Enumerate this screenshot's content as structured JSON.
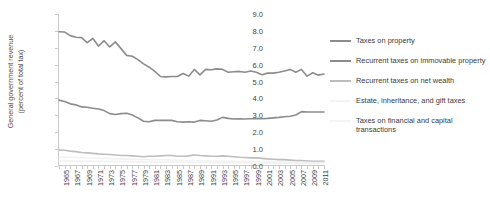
{
  "chart_data": {
    "type": "line",
    "title": "",
    "xlabel": "",
    "ylabel": "General government revenue\n(percent of total tax)",
    "ylim": [
      0.0,
      9.0
    ],
    "xlim": [
      1965,
      2012
    ],
    "grid": false,
    "legend_position": "right",
    "ytick_labels": [
      "0.0",
      "1.0",
      "2.0",
      "3.0",
      "4.0",
      "5.0",
      "6.0",
      "7.0",
      "8.0",
      "9.0"
    ],
    "ytick_values": [
      0.0,
      1.0,
      2.0,
      3.0,
      4.0,
      5.0,
      6.0,
      7.0,
      8.0,
      9.0
    ],
    "x": [
      1965,
      1966,
      1967,
      1968,
      1969,
      1970,
      1971,
      1972,
      1973,
      1974,
      1975,
      1976,
      1977,
      1978,
      1979,
      1980,
      1981,
      1982,
      1983,
      1984,
      1985,
      1986,
      1987,
      1988,
      1989,
      1990,
      1991,
      1992,
      1993,
      1994,
      1995,
      1996,
      1997,
      1998,
      1999,
      2000,
      2001,
      2002,
      2003,
      2004,
      2005,
      2006,
      2007,
      2008,
      2009,
      2010,
      2011,
      2012
    ],
    "xtick_labels": [
      "1965",
      "1967",
      "1969",
      "1971",
      "1973",
      "1975",
      "1977",
      "1979",
      "1981",
      "1983",
      "1985",
      "1987",
      "1989",
      "1991",
      "1993",
      "1995",
      "1997",
      "1999",
      "2001",
      "2003",
      "2005",
      "2007",
      "2009",
      "2011"
    ],
    "series": [
      {
        "name": "Taxes on property",
        "color": "#8c8c8c",
        "values": [
          7.95,
          7.93,
          7.72,
          7.62,
          7.6,
          7.3,
          7.55,
          7.1,
          7.42,
          7.05,
          7.35,
          6.95,
          6.55,
          6.5,
          6.3,
          6.05,
          5.85,
          5.6,
          5.3,
          5.28,
          5.3,
          5.3,
          5.48,
          5.32,
          5.72,
          5.4,
          5.72,
          5.7,
          5.75,
          5.72,
          5.55,
          5.58,
          5.6,
          5.55,
          5.62,
          5.55,
          5.4,
          5.5,
          5.5,
          5.55,
          5.62,
          5.72,
          5.55,
          5.72,
          5.32,
          5.52,
          5.38,
          5.45
        ]
      },
      {
        "name": "Recurrent taxes on immovable property",
        "color": "#8c8c8c",
        "values": [
          3.9,
          3.82,
          3.68,
          3.62,
          3.5,
          3.48,
          3.42,
          3.38,
          3.28,
          3.1,
          3.05,
          3.1,
          3.12,
          3.02,
          2.85,
          2.65,
          2.62,
          2.7,
          2.7,
          2.7,
          2.7,
          2.62,
          2.6,
          2.62,
          2.6,
          2.7,
          2.68,
          2.65,
          2.72,
          2.88,
          2.82,
          2.78,
          2.8,
          2.78,
          2.8,
          2.8,
          2.8,
          2.82,
          2.85,
          2.88,
          2.92,
          2.95,
          3.02,
          3.22,
          3.2,
          3.2,
          3.2,
          3.2
        ]
      },
      {
        "name": "Recurrent taxes on net wealth",
        "color": "#bdbdbd",
        "values": [
          0.95,
          0.93,
          0.88,
          0.85,
          0.8,
          0.78,
          0.75,
          0.72,
          0.7,
          0.68,
          0.65,
          0.62,
          0.62,
          0.6,
          0.58,
          0.55,
          0.58,
          0.58,
          0.6,
          0.62,
          0.62,
          0.58,
          0.58,
          0.6,
          0.65,
          0.62,
          0.6,
          0.58,
          0.58,
          0.6,
          0.58,
          0.55,
          0.52,
          0.5,
          0.48,
          0.48,
          0.45,
          0.42,
          0.4,
          0.38,
          0.38,
          0.35,
          0.32,
          0.32,
          0.3,
          0.28,
          0.28,
          0.28
        ]
      },
      {
        "name": "Estate, inheritance, and gift taxes",
        "color": "#f2f2f2",
        "values": [
          0.52,
          0.51,
          0.5,
          0.5,
          0.49,
          0.48,
          0.47,
          0.46,
          0.45,
          0.44,
          0.43,
          0.42,
          0.41,
          0.4,
          0.4,
          0.39,
          0.38,
          0.38,
          0.37,
          0.36,
          0.35,
          0.34,
          0.34,
          0.33,
          0.33,
          0.32,
          0.31,
          0.3,
          0.3,
          0.29,
          0.28,
          0.28,
          0.27,
          0.27,
          0.26,
          0.26,
          0.25,
          0.25,
          0.24,
          0.24,
          0.23,
          0.23,
          0.22,
          0.22,
          0.21,
          0.21,
          0.2,
          0.2
        ]
      },
      {
        "name": "Taxes on financial and capital transactions",
        "color": "#f2f2f2",
        "values": [
          0.3,
          0.3,
          0.29,
          0.29,
          0.28,
          0.28,
          0.28,
          0.27,
          0.27,
          0.26,
          0.26,
          0.26,
          0.25,
          0.25,
          0.25,
          0.24,
          0.24,
          0.24,
          0.23,
          0.23,
          0.23,
          0.22,
          0.22,
          0.22,
          0.21,
          0.21,
          0.21,
          0.2,
          0.2,
          0.2,
          0.19,
          0.19,
          0.19,
          0.18,
          0.18,
          0.18,
          0.17,
          0.17,
          0.17,
          0.16,
          0.16,
          0.16,
          0.15,
          0.15,
          0.15,
          0.14,
          0.14,
          0.14
        ]
      }
    ]
  },
  "legend": {
    "items": [
      {
        "label": "Taxes on property",
        "color": "#8c8c8c"
      },
      {
        "label": "Recurrent taxes on immovable property",
        "color": "#8c8c8c"
      },
      {
        "label": "Recurrent taxes on net wealth",
        "color": "#bdbdbd"
      },
      {
        "label": "Estate, inheritance, and gift taxes",
        "color": "#f4f4f4"
      },
      {
        "label": "Taxes on financial and capital transactions",
        "color": "#f4f4f4"
      }
    ]
  }
}
